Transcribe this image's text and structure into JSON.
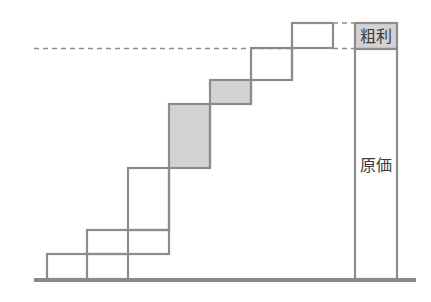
{
  "diagram": {
    "labels": {
      "gross_profit": "粗利",
      "cost": "原価"
    },
    "colors": {
      "stroke": "#8c8c8c",
      "shaded_fill": "#d3d3d3",
      "background": "#ffffff",
      "baseline": "#8a8a8a"
    },
    "steps": [
      {
        "id": 1,
        "shaded": false
      },
      {
        "id": 2,
        "shaded": false
      },
      {
        "id": 3,
        "shaded": false
      },
      {
        "id": 4,
        "shaded": true
      },
      {
        "id": 5,
        "shaded": true
      },
      {
        "id": 6,
        "shaded": false
      },
      {
        "id": 7,
        "shaded": false
      }
    ]
  }
}
